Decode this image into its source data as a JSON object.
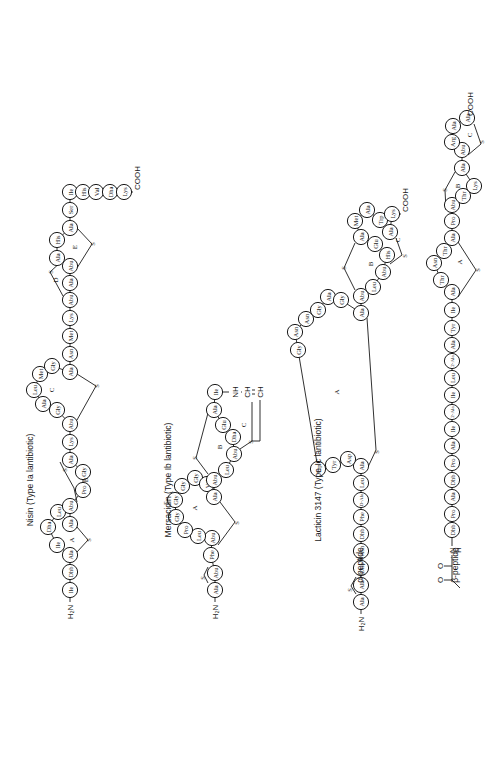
{
  "figure": {
    "rotation": "-90deg"
  },
  "structures": [
    {
      "id": "nisin",
      "title": "Nisin (Type Ia lantibiotic)",
      "title_pos": [
        30,
        480
      ],
      "n_term": {
        "text": "H₂N",
        "pos": [
          70,
          608
        ]
      },
      "c_term": {
        "text": "COOH",
        "pos": [
          137,
          175
        ]
      },
      "residues": [
        {
          "n": "Ile",
          "x": 70,
          "y": 590
        },
        {
          "n": "Dhb",
          "x": 70,
          "y": 572
        },
        {
          "n": "Ala",
          "x": 70,
          "y": 555
        },
        {
          "n": "Ile",
          "x": 57,
          "y": 545
        },
        {
          "n": "Dha",
          "x": 48,
          "y": 527
        },
        {
          "n": "Leu",
          "x": 58,
          "y": 512
        },
        {
          "n": "Ala",
          "x": 70,
          "y": 524
        },
        {
          "n": "Abu",
          "x": 70,
          "y": 506
        },
        {
          "n": "Pro",
          "x": 83,
          "y": 490
        },
        {
          "n": "Gly",
          "x": 83,
          "y": 472
        },
        {
          "n": "Ala",
          "x": 70,
          "y": 460
        },
        {
          "n": "Lys",
          "x": 70,
          "y": 442
        },
        {
          "n": "Abu",
          "x": 70,
          "y": 424
        },
        {
          "n": "Gly",
          "x": 57,
          "y": 410
        },
        {
          "n": "Ala",
          "x": 43,
          "y": 404
        },
        {
          "n": "Leu",
          "x": 34,
          "y": 390
        },
        {
          "n": "Met",
          "x": 40,
          "y": 374
        },
        {
          "n": "Gly",
          "x": 52,
          "y": 366
        },
        {
          "n": "Ala",
          "x": 70,
          "y": 372
        },
        {
          "n": "Asn",
          "x": 70,
          "y": 354
        },
        {
          "n": "Met",
          "x": 70,
          "y": 336
        },
        {
          "n": "Lys",
          "x": 70,
          "y": 318
        },
        {
          "n": "Abu",
          "x": 70,
          "y": 300
        },
        {
          "n": "Ala",
          "x": 70,
          "y": 283
        },
        {
          "n": "Abu",
          "x": 70,
          "y": 266
        },
        {
          "n": "Ala",
          "x": 57,
          "y": 258
        },
        {
          "n": "His",
          "x": 57,
          "y": 240
        },
        {
          "n": "Ala",
          "x": 70,
          "y": 228
        },
        {
          "n": "Ser",
          "x": 70,
          "y": 210
        },
        {
          "n": "Ile",
          "x": 70,
          "y": 192
        },
        {
          "n": "His",
          "x": 83,
          "y": 192
        },
        {
          "n": "Val",
          "x": 96,
          "y": 192
        },
        {
          "n": "Dha",
          "x": 110,
          "y": 192
        },
        {
          "n": "Lys",
          "x": 124,
          "y": 192
        }
      ],
      "rings": [
        {
          "label": "A",
          "x": 72,
          "y": 540
        },
        {
          "label": "B",
          "x": 86,
          "y": 480
        },
        {
          "label": "C",
          "x": 52,
          "y": 390
        },
        {
          "label": "D",
          "x": 56,
          "y": 280
        },
        {
          "label": "E",
          "x": 75,
          "y": 247
        }
      ],
      "bridges": [
        {
          "path": "M77,552 L88,540 L77,527",
          "s": [
            88,
            540
          ]
        },
        {
          "path": "M77,502 L74,488 L64,470 L60,462",
          "s": [
            64,
            470
          ]
        },
        {
          "path": "M77,420 L96,386 L77,374",
          "s": [
            96,
            386
          ]
        },
        {
          "path": "M63,296 L50,272 L63,260",
          "s": [
            50,
            272
          ]
        },
        {
          "path": "M77,268 L92,244 L77,228",
          "s": [
            92,
            244
          ]
        }
      ]
    },
    {
      "id": "mersacidin",
      "title": "Mersacidin (Type Ib lantibiotic)",
      "title_pos": [
        168,
        480
      ],
      "n_term": {
        "text": "H₂N",
        "pos": [
          215,
          608
        ]
      },
      "residues": [
        {
          "n": "Ala",
          "x": 215,
          "y": 590
        },
        {
          "n": "Abu",
          "x": 215,
          "y": 573
        },
        {
          "n": "Phe",
          "x": 211,
          "y": 555
        },
        {
          "n": "Abu",
          "x": 212,
          "y": 538
        },
        {
          "n": "Leu",
          "x": 198,
          "y": 536
        },
        {
          "n": "Pro",
          "x": 185,
          "y": 530
        },
        {
          "n": "Gly",
          "x": 176,
          "y": 517
        },
        {
          "n": "Gly",
          "x": 175,
          "y": 500
        },
        {
          "n": "Gly",
          "x": 182,
          "y": 486
        },
        {
          "n": "Gly",
          "x": 195,
          "y": 478
        },
        {
          "n": "Val",
          "x": 207,
          "y": 484
        },
        {
          "n": "Ala",
          "x": 214,
          "y": 497
        },
        {
          "n": "Abu",
          "x": 214,
          "y": 480
        },
        {
          "n": "Leu",
          "x": 226,
          "y": 470
        },
        {
          "n": "Abu",
          "x": 234,
          "y": 454
        },
        {
          "n": "Dha",
          "x": 233,
          "y": 437
        },
        {
          "n": "Glu",
          "x": 223,
          "y": 425
        },
        {
          "n": "Ala",
          "x": 214,
          "y": 410
        },
        {
          "n": "Ile",
          "x": 215,
          "y": 392
        }
      ],
      "rings": [
        {
          "label": "A",
          "x": 195,
          "y": 508
        },
        {
          "label": "B",
          "x": 220,
          "y": 447
        },
        {
          "label": "C",
          "x": 244,
          "y": 425
        }
      ],
      "side_chain": {
        "nh": "NH",
        "ch1": "CH",
        "ch2": "CH"
      },
      "bridges": [
        {
          "path": "M208,583 L204,575 L208,567",
          "s": [
            202,
            578
          ]
        },
        {
          "path": "M218,545 L235,522 L220,502",
          "s": [
            236,
            523
          ]
        },
        {
          "path": "M208,474 L196,458 L208,413",
          "s": [
            194,
            458
          ]
        },
        {
          "path": "M240,449 L252,441 L252,402",
          "s": [
            250,
            442
          ]
        }
      ]
    },
    {
      "id": "lacticin-3147",
      "title": "Lacticin 3147 (Type Ic lantibiotic)",
      "title_pos": [
        318,
        480
      ],
      "peptides": [
        {
          "id": "alpha",
          "label": "α-peptide",
          "label_pos": [
            360,
            565
          ],
          "n_term": {
            "text": "H₂N",
            "pos": [
              361,
              620
            ]
          },
          "c_term": {
            "text": "COOH",
            "pos": [
              405,
              210
            ]
          },
          "residues": [
            {
              "n": "Ala",
              "x": 361,
              "y": 602
            },
            {
              "n": "Ala",
              "x": 361,
              "y": 585
            },
            {
              "n": "Dhb",
              "x": 361,
              "y": 568
            },
            {
              "n": "Asn",
              "x": 361,
              "y": 551
            },
            {
              "n": "Dhb",
              "x": 361,
              "y": 534
            },
            {
              "n": "Phe",
              "x": 361,
              "y": 517
            },
            {
              "n": "D-Ala",
              "x": 361,
              "y": 500
            },
            {
              "n": "Leu",
              "x": 361,
              "y": 483
            },
            {
              "n": "Ala",
              "x": 361,
              "y": 466
            },
            {
              "n": "Asp",
              "x": 348,
              "y": 459
            },
            {
              "n": "Tyr",
              "x": 333,
              "y": 465
            },
            {
              "n": "Trp",
              "x": 318,
              "y": 469
            },
            {
              "n": "Gly",
              "x": 298,
              "y": 350
            },
            {
              "n": "Asn",
              "x": 295,
              "y": 332
            },
            {
              "n": "Asn",
              "x": 306,
              "y": 319
            },
            {
              "n": "Gly",
              "x": 318,
              "y": 310
            },
            {
              "n": "Ala",
              "x": 328,
              "y": 297
            },
            {
              "n": "Gly",
              "x": 341,
              "y": 300
            },
            {
              "n": "Ala",
              "x": 361,
              "y": 313
            },
            {
              "n": "Abu",
              "x": 361,
              "y": 296
            },
            {
              "n": "Leu",
              "x": 373,
              "y": 287
            },
            {
              "n": "Abu",
              "x": 383,
              "y": 272
            },
            {
              "n": "His",
              "x": 387,
              "y": 255
            },
            {
              "n": "Glu",
              "x": 375,
              "y": 244
            },
            {
              "n": "Ala",
              "x": 361,
              "y": 237
            },
            {
              "n": "Met",
              "x": 355,
              "y": 221
            },
            {
              "n": "Ala",
              "x": 367,
              "y": 210
            },
            {
              "n": "Trp",
              "x": 380,
              "y": 220
            },
            {
              "n": "Ala",
              "x": 390,
              "y": 232
            },
            {
              "n": "Lys",
              "x": 392,
              "y": 214
            }
          ],
          "rings": [
            {
              "label": "A",
              "x": 337,
              "y": 392
            },
            {
              "label": "B",
              "x": 371,
              "y": 264
            },
            {
              "label": "C",
              "x": 398,
              "y": 240
            }
          ],
          "bridges": [
            {
              "path": "M356,594 L351,586 L356,577",
              "s": [
                349,
                590
              ]
            },
            {
              "path": "M368,467 L376,450 L367,318",
              "s": [
                376,
                452
              ]
            },
            {
              "path": "M355,290 L344,268 L355,243",
              "s": [
                343,
                268
              ]
            },
            {
              "path": "M390,264 L402,255 L396,238",
              "s": [
                404,
                256
              ]
            }
          ]
        },
        {
          "id": "beta",
          "label": "β-peptide",
          "label_pos": [
            455,
            565
          ],
          "n_term_group": {
            "h": "H",
            "n": "N",
            "o1": "O",
            "o2": "O"
          },
          "c_term": {
            "text": "COOH",
            "pos": [
              470,
              55
            ]
          },
          "residues": [
            {
              "n": "Dhb",
              "x": 452,
              "y": 530
            },
            {
              "n": "Pro",
              "x": 452,
              "y": 514
            },
            {
              "n": "Ala",
              "x": 452,
              "y": 497
            },
            {
              "n": "Dhb",
              "x": 452,
              "y": 480
            },
            {
              "n": "Pro",
              "x": 452,
              "y": 463
            },
            {
              "n": "Ala",
              "x": 452,
              "y": 446
            },
            {
              "n": "Ile",
              "x": 452,
              "y": 429
            },
            {
              "n": "2-Ala",
              "x": 452,
              "y": 412
            },
            {
              "n": "Ile",
              "x": 452,
              "y": 395
            },
            {
              "n": "Leu",
              "x": 452,
              "y": 378
            },
            {
              "n": "2-Ala",
              "x": 452,
              "y": 361
            },
            {
              "n": "Ala",
              "x": 452,
              "y": 345
            },
            {
              "n": "Tyr",
              "x": 452,
              "y": 328
            },
            {
              "n": "Ile",
              "x": 452,
              "y": 310
            },
            {
              "n": "Ala",
              "x": 452,
              "y": 292
            },
            {
              "n": "Thr",
              "x": 441,
              "y": 280
            },
            {
              "n": "Asn",
              "x": 434,
              "y": 263
            },
            {
              "n": "Thr",
              "x": 444,
              "y": 251
            },
            {
              "n": "Ala",
              "x": 452,
              "y": 238
            },
            {
              "n": "Pro",
              "x": 452,
              "y": 221
            },
            {
              "n": "Abu",
              "x": 452,
              "y": 205
            },
            {
              "n": "Thr",
              "x": 463,
              "y": 196
            },
            {
              "n": "Lys",
              "x": 474,
              "y": 186
            },
            {
              "n": "Ala",
              "x": 462,
              "y": 168
            },
            {
              "n": "Abu",
              "x": 462,
              "y": 150
            },
            {
              "n": "Arg",
              "x": 452,
              "y": 142
            },
            {
              "n": "Ala",
              "x": 453,
              "y": 126
            },
            {
              "n": "Ala",
              "x": 467,
              "y": 118
            }
          ],
          "rings": [
            {
              "label": "A",
              "x": 460,
              "y": 262
            },
            {
              "label": "B",
              "x": 458,
              "y": 186
            },
            {
              "label": "C",
              "x": 470,
              "y": 135
            }
          ],
          "bridges": [
            {
              "path": "M458,297 L476,270 L458,242",
              "s": [
                477,
                270
              ]
            },
            {
              "path": "M446,210 L445,190 L455,172",
              "s": [
                444,
                190
              ]
            },
            {
              "path": "M468,155 L481,144 L474,124",
              "s": [
                481,
                142
              ]
            }
          ]
        }
      ]
    }
  ]
}
